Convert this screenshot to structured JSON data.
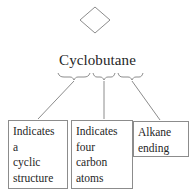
{
  "diagram": {
    "type": "nomenclature-breakdown",
    "top_shape": {
      "name": "cyclobutane-square-skeletal-structure",
      "shape": "diamond",
      "label": ""
    },
    "term": {
      "full": "Cyclobutane",
      "segments": [
        {
          "text": "Cyclo",
          "brace": true
        },
        {
          "text": "but",
          "brace": true
        },
        {
          "text": "ane",
          "brace": true
        }
      ]
    },
    "notes": [
      {
        "id": "cyclic",
        "lines": [
          "Indicates",
          "a",
          "cyclic",
          "structure"
        ]
      },
      {
        "id": "carbons",
        "lines": [
          "Indicates",
          "four",
          "carbon",
          "atoms"
        ]
      },
      {
        "id": "ending",
        "lines": [
          "Alkane",
          "ending"
        ]
      }
    ],
    "colors": {
      "stroke": "#8c8c8c",
      "text": "#262626",
      "background": "#ffffff"
    }
  }
}
